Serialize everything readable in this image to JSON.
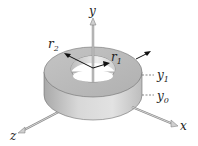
{
  "figure": {
    "type": "annular-ring-3d-diagram",
    "axes": {
      "y_label": "y",
      "x_label": "x",
      "z_label": "z"
    },
    "radii": {
      "outer": "r",
      "outer_sub": "2",
      "inner": "r",
      "inner_sub": "1"
    },
    "heights": {
      "top": "y",
      "top_sub": "1",
      "bottom": "y",
      "bottom_sub": "0"
    },
    "colors": {
      "ring_top": "#b8b8b8",
      "ring_side": "#cfcfcf",
      "hole_inner": "#e4e4e4",
      "axis": "#9a9a9a",
      "arrow": "#111111"
    }
  }
}
